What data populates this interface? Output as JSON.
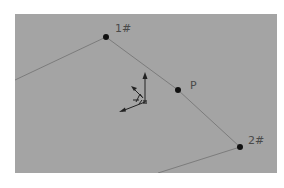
{
  "viewport": {
    "background": "#a4a4a4",
    "line_color": "#7c7c7c",
    "point_color": "#111111"
  },
  "points": [
    {
      "id": "1#",
      "label": "1#",
      "x": 91,
      "y": 23
    },
    {
      "id": "P",
      "label": "P",
      "x": 163,
      "y": 76
    },
    {
      "id": "2#",
      "label": "2#",
      "x": 225,
      "y": 133
    }
  ],
  "polyline": {
    "start": {
      "x": 0,
      "y": 66
    },
    "end": {
      "x": 143,
      "y": 159
    }
  },
  "triad": {
    "icon": "coordinate-triad-icon",
    "origin": {
      "x": 130,
      "y": 88
    }
  }
}
